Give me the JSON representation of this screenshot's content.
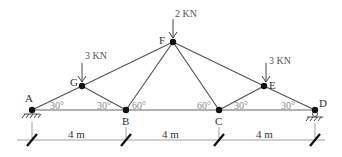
{
  "diagram": {
    "type": "truss",
    "nodes": {
      "A": {
        "label": "A"
      },
      "G": {
        "label": "G"
      },
      "B": {
        "label": "B"
      },
      "F": {
        "label": "F"
      },
      "C": {
        "label": "C"
      },
      "E": {
        "label": "E"
      },
      "D": {
        "label": "D"
      }
    },
    "members": [
      [
        "A",
        "G"
      ],
      [
        "G",
        "B"
      ],
      [
        "G",
        "F"
      ],
      [
        "B",
        "F"
      ],
      [
        "F",
        "C"
      ],
      [
        "F",
        "E"
      ],
      [
        "C",
        "E"
      ],
      [
        "E",
        "D"
      ],
      [
        "A",
        "D"
      ]
    ],
    "loads": [
      {
        "node": "G",
        "label": "3 KN"
      },
      {
        "node": "F",
        "label": "2 KN"
      },
      {
        "node": "E",
        "label": "3 KN"
      }
    ],
    "angles": [
      {
        "near": "A",
        "label": "30°"
      },
      {
        "near": "B-left",
        "label": "30°"
      },
      {
        "near": "B-right",
        "label": "60°"
      },
      {
        "near": "C-left",
        "label": "60°"
      },
      {
        "near": "C-right",
        "label": "30°"
      },
      {
        "near": "D",
        "label": "30°"
      }
    ],
    "dimensions": [
      "4 m",
      "4 m",
      "4 m"
    ],
    "supports": {
      "A": "pin",
      "D": "roller"
    }
  }
}
